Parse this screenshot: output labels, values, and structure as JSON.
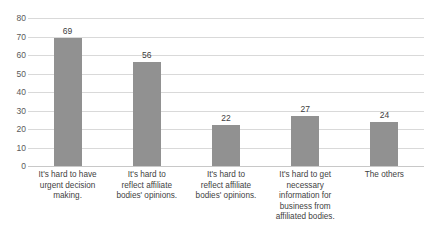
{
  "chart_data": {
    "type": "bar",
    "title": "",
    "subtitle": "",
    "xlabel": "",
    "ylabel": "",
    "ylim": [
      0,
      80
    ],
    "ytick_step": 10,
    "yticks": [
      "80",
      "70",
      "60",
      "50",
      "40",
      "30",
      "20",
      "10",
      "0"
    ],
    "grid": true,
    "legend": false,
    "legend_position": "none",
    "categories": [
      "It's hard to have urgent decision making.",
      "It's hard to reflect affiliate bodies' opinions.",
      "It's hard to reflect affiliate bodies' opinions.",
      "It's hard to get necessary information for business from affiliated bodies.",
      "The others"
    ],
    "category_lines": [
      [
        "It's hard to have",
        "urgent decision",
        "making."
      ],
      [
        "It's hard to",
        "reflect affiliate",
        "bodies' opinions."
      ],
      [
        "It's hard to",
        "reflect affiliate",
        "bodies' opinions."
      ],
      [
        "It's hard to get",
        "necessary",
        "information for",
        "business from",
        "affiliated bodies."
      ],
      [
        "The others"
      ]
    ],
    "values": [
      69,
      56,
      22,
      27,
      24
    ],
    "value_labels": [
      "69",
      "56",
      "22",
      "27",
      "24"
    ],
    "colors": {
      "bar": "#919191",
      "gridline": "#d9d9d9",
      "baseline": "#c8c8c8",
      "tick_text": "#5a5a5a",
      "value_text": "#404040",
      "category_text": "#3f3f3f",
      "background": "#ffffff"
    }
  }
}
